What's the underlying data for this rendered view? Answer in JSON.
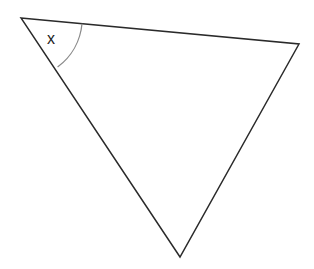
{
  "diagram": {
    "type": "triangle",
    "vertices": {
      "top_left": [
        21,
        18
      ],
      "top_right": [
        299,
        44
      ],
      "bottom": [
        180,
        257
      ]
    },
    "angle_marker": {
      "vertex": "top_left",
      "radius": 61,
      "label": "x"
    },
    "colors": {
      "stroke": "#2a2a2a",
      "arc": "#8a8a8a",
      "background": "#ffffff"
    }
  }
}
